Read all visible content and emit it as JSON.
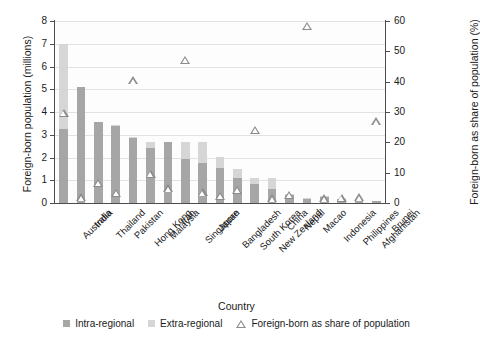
{
  "chart_data": {
    "type": "bar",
    "title": "",
    "xlabel": "Country",
    "ylabel": "Foreign-born population (millions)",
    "ylabel_right": "Foreign-born as share of population (%)",
    "ylim": [
      0,
      8
    ],
    "ylim_right": [
      0,
      60
    ],
    "yticks": [
      0,
      1,
      2,
      3,
      4,
      5,
      6,
      7,
      8
    ],
    "yticks_right": [
      0,
      10,
      20,
      30,
      40,
      50,
      60
    ],
    "grid": true,
    "legend_position": "bottom",
    "categories": [
      "Australia",
      "India",
      "Thailand",
      "Pakistan",
      "Hong Kong",
      "Malaysia",
      "Iran",
      "Singapore",
      "Japan",
      "Bangladesh",
      "South Korea",
      "New Zealand",
      "China",
      "Nepal",
      "Macao",
      "Indonesia",
      "Philippines",
      "Afghanistan",
      "Brunei"
    ],
    "series": [
      {
        "name": "Intra-regional",
        "color": "#a6a6a6",
        "values": [
          3.25,
          5.08,
          3.55,
          3.38,
          2.85,
          2.42,
          2.68,
          1.92,
          1.78,
          1.52,
          1.08,
          0.82,
          0.62,
          0.36,
          0.18,
          0.28,
          0.17,
          0.1,
          0.08
        ]
      },
      {
        "name": "Extra-regional",
        "color": "#d6d6d6",
        "values": [
          3.75,
          0.04,
          0.03,
          0.03,
          0.04,
          0.26,
          0.02,
          0.78,
          0.92,
          0.5,
          0.42,
          0.3,
          0.48,
          0.04,
          0.05,
          0.03,
          0.02,
          0.02,
          0.02
        ]
      }
    ],
    "marker_series": {
      "name": "Foreign-born as share of population",
      "color": "#8c8c8c",
      "marker": "triangle-up",
      "values": [
        28.2,
        0.4,
        5.2,
        1.9,
        39.0,
        8.2,
        3.3,
        45.8,
        2.0,
        0.9,
        2.8,
        22.6,
        0.1,
        1.3,
        57.0,
        0.1,
        0.2,
        0.4,
        25.4
      ]
    }
  },
  "legend": {
    "items": [
      {
        "label": "Intra-regional",
        "swatch": "square-dark"
      },
      {
        "label": "Extra-regional",
        "swatch": "square-light"
      },
      {
        "label": "Foreign-born as share of population",
        "swatch": "triangle-up"
      }
    ]
  }
}
